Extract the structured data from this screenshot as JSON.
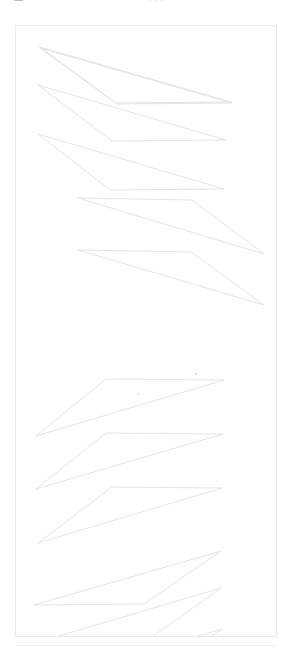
{
  "page": {
    "width": 291,
    "height": 654,
    "background_color": "#ffffff"
  },
  "header": {
    "clipped_label_left": "—",
    "clipped_label_mid": "· · ·"
  },
  "panel": {
    "name": "drawing-canvas",
    "border_color": "#e9e9ed",
    "background_color": "#ffffff",
    "x": 15,
    "y": 25,
    "width": 262,
    "height": 612
  },
  "style": {
    "stroke_color": "#e4e4e8",
    "stroke_width": 1,
    "marker_color": "#dcdce1"
  },
  "chart_data": {
    "type": "line",
    "title": "",
    "subtitle": "",
    "xlabel": "",
    "ylabel": "",
    "grid": false,
    "legend": "none",
    "xlim": [
      0,
      260
    ],
    "ylim": [
      0,
      610
    ],
    "series": [
      {
        "name": "sliver-1",
        "direction": "descending",
        "points": [
          [
            24,
            21
          ],
          [
            215,
            76
          ],
          [
            100,
            77
          ],
          [
            24,
            21
          ]
        ]
      },
      {
        "name": "sliver-2",
        "direction": "descending",
        "points": [
          [
            24,
            22
          ],
          [
            216,
            77
          ],
          [
            101,
            78
          ],
          [
            24,
            22
          ]
        ]
      },
      {
        "name": "sliver-3",
        "direction": "descending",
        "points": [
          [
            22,
            59
          ],
          [
            210,
            114
          ],
          [
            96,
            115
          ],
          [
            22,
            59
          ]
        ]
      },
      {
        "name": "sliver-4",
        "direction": "descending",
        "points": [
          [
            22,
            108
          ],
          [
            208,
            163
          ],
          [
            94,
            164
          ],
          [
            22,
            108
          ]
        ]
      },
      {
        "name": "sliver-5",
        "direction": "descending",
        "points": [
          [
            62,
            172
          ],
          [
            248,
            228
          ],
          [
            176,
            174
          ],
          [
            62,
            172
          ]
        ]
      },
      {
        "name": "sliver-6",
        "direction": "descending",
        "points": [
          [
            62,
            224
          ],
          [
            248,
            279
          ],
          [
            175,
            226
          ],
          [
            62,
            224
          ]
        ]
      },
      {
        "name": "sliver-7",
        "direction": "ascending",
        "points": [
          [
            20,
            410
          ],
          [
            208,
            354
          ],
          [
            90,
            353
          ],
          [
            20,
            410
          ]
        ]
      },
      {
        "name": "sliver-8",
        "direction": "ascending",
        "points": [
          [
            20,
            463
          ],
          [
            207,
            408
          ],
          [
            90,
            407
          ],
          [
            20,
            463
          ]
        ]
      },
      {
        "name": "sliver-9",
        "direction": "ascending",
        "points": [
          [
            22,
            517
          ],
          [
            206,
            462
          ],
          [
            96,
            461
          ],
          [
            22,
            517
          ]
        ]
      },
      {
        "name": "sliver-10",
        "direction": "ascending",
        "points": [
          [
            18,
            579
          ],
          [
            205,
            525
          ],
          [
            128,
            578
          ],
          [
            18,
            579
          ]
        ]
      },
      {
        "name": "sliver-11",
        "direction": "ascending",
        "points": [
          [
            19,
            617
          ],
          [
            205,
            562
          ],
          [
            129,
            616
          ],
          [
            19,
            617
          ]
        ]
      },
      {
        "name": "sliver-12",
        "direction": "ascending",
        "points": [
          [
            20,
            658
          ],
          [
            206,
            603
          ],
          [
            130,
            657
          ],
          [
            20,
            658
          ]
        ]
      }
    ],
    "markers": [
      {
        "name": "marker-a",
        "x": 180,
        "y": 348,
        "r": 1.2
      },
      {
        "name": "marker-b",
        "x": 122,
        "y": 368,
        "r": 0.9
      }
    ]
  }
}
